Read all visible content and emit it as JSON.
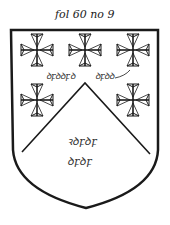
{
  "caption": "fol 60 no 9",
  "labels": {
    "left_scroll": "ꝺꝼꝺꝺꝼꝺ",
    "right_scroll": "ꝺꝼꝺꝺ",
    "center_line1": "ꝛꝺꝼꝺꝼ",
    "center_line2": "ꝺꝼꝺꝼ"
  },
  "colors": {
    "ink": "#1a1a1a",
    "background": "#ffffff"
  }
}
